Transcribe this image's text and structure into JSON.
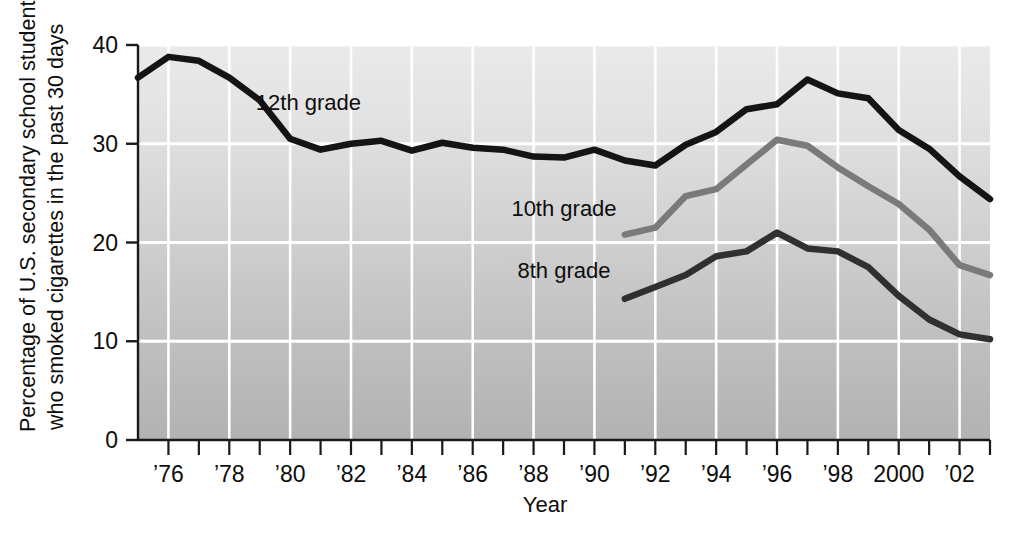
{
  "chart_data": {
    "type": "line",
    "title": "",
    "xlabel": "Year",
    "ylabel": "Percentage of U.S. secondary school students who smoked cigarettes in the past 30 days",
    "ylabel_line1": "Percentage of U.S. secondary school students",
    "ylabel_line2": "who smoked cigarettes in the past 30 days",
    "xlim": [
      1975,
      2003
    ],
    "ylim": [
      0,
      40
    ],
    "yticks": [
      0,
      10,
      20,
      30,
      40
    ],
    "ytick_labels": [
      "0",
      "10",
      "20",
      "30",
      "40"
    ],
    "xticks": [
      1975,
      1976,
      1977,
      1978,
      1979,
      1980,
      1981,
      1982,
      1983,
      1984,
      1985,
      1986,
      1987,
      1988,
      1989,
      1990,
      1991,
      1992,
      1993,
      1994,
      1995,
      1996,
      1997,
      1998,
      1999,
      2000,
      2001,
      2002,
      2003
    ],
    "xtick_labels": [
      {
        "x": 1976,
        "label": "’76"
      },
      {
        "x": 1978,
        "label": "’78"
      },
      {
        "x": 1980,
        "label": "’80"
      },
      {
        "x": 1982,
        "label": "’82"
      },
      {
        "x": 1984,
        "label": "’84"
      },
      {
        "x": 1986,
        "label": "’86"
      },
      {
        "x": 1988,
        "label": "’88"
      },
      {
        "x": 1990,
        "label": "’90"
      },
      {
        "x": 1992,
        "label": "’92"
      },
      {
        "x": 1994,
        "label": "’94"
      },
      {
        "x": 1996,
        "label": "’96"
      },
      {
        "x": 1998,
        "label": "’98"
      },
      {
        "x": 2000,
        "label": "2000"
      },
      {
        "x": 2002,
        "label": "’02"
      }
    ],
    "grid": true,
    "grid_color": "#ffffff",
    "plot_bg_top": "#e9e9e9",
    "plot_bg_bottom": "#b4b4b4",
    "legend_position": "inline-annotations",
    "series": [
      {
        "name": "12th grade",
        "color": "#141414",
        "label_x": 1980.6,
        "label_y": 34.2,
        "x": [
          1975,
          1976,
          1977,
          1978,
          1979,
          1980,
          1981,
          1982,
          1983,
          1984,
          1985,
          1986,
          1987,
          1988,
          1989,
          1990,
          1991,
          1992,
          1993,
          1994,
          1995,
          1996,
          1997,
          1998,
          1999,
          2000,
          2001,
          2002,
          2003
        ],
        "values": [
          36.7,
          38.8,
          38.4,
          36.7,
          34.4,
          30.5,
          29.4,
          30.0,
          30.3,
          29.3,
          30.1,
          29.6,
          29.4,
          28.7,
          28.6,
          29.4,
          28.3,
          27.8,
          29.9,
          31.2,
          33.5,
          34.0,
          36.5,
          35.1,
          34.6,
          31.4,
          29.5,
          26.7,
          24.4
        ]
      },
      {
        "name": "10th grade",
        "color": "#7a7a7a",
        "label_x": 1989.0,
        "label_y": 23.5,
        "x": [
          1991,
          1992,
          1993,
          1994,
          1995,
          1996,
          1997,
          1998,
          1999,
          2000,
          2001,
          2002,
          2003
        ],
        "values": [
          20.8,
          21.5,
          24.7,
          25.4,
          27.9,
          30.4,
          29.8,
          27.6,
          25.7,
          23.9,
          21.3,
          17.7,
          16.7
        ]
      },
      {
        "name": "8th grade",
        "color": "#303030",
        "label_x": 1989.0,
        "label_y": 17.2,
        "x": [
          1991,
          1992,
          1993,
          1994,
          1995,
          1996,
          1997,
          1998,
          1999,
          2000,
          2001,
          2002,
          2003
        ],
        "values": [
          14.3,
          15.5,
          16.7,
          18.6,
          19.1,
          21.0,
          19.4,
          19.1,
          17.5,
          14.6,
          12.2,
          10.7,
          10.2
        ]
      }
    ]
  }
}
